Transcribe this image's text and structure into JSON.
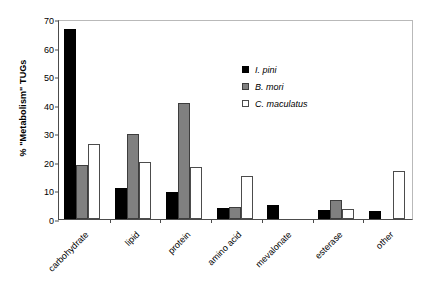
{
  "chart_data": {
    "type": "bar",
    "title": "",
    "xlabel": "",
    "ylabel": "% \"Metabolism\" TUGs",
    "ylim": [
      0,
      70
    ],
    "yticks": [
      0,
      10,
      20,
      30,
      40,
      50,
      60,
      70
    ],
    "ytick_labels": [
      "0",
      "10",
      "20",
      "30",
      "40",
      "50",
      "60",
      "70"
    ],
    "grid": false,
    "legend_position": "inside-upper-right",
    "categories": [
      "carbohydrate",
      "lipid",
      "protein",
      "amino acid",
      "mevalonate",
      "esterase",
      "other"
    ],
    "series": [
      {
        "name": "I. pini",
        "color": "#000000",
        "values": [
          66.5,
          10.7,
          9.3,
          4.0,
          5.0,
          3.0,
          2.9
        ]
      },
      {
        "name": "B. mori",
        "color": "#808080",
        "values": [
          19.0,
          29.8,
          40.7,
          4.3,
          0,
          6.8,
          0
        ]
      },
      {
        "name": "C. maculatus",
        "color": "#ffffff",
        "values": [
          26.3,
          20.0,
          18.2,
          15.0,
          0,
          3.5,
          16.7
        ]
      }
    ]
  },
  "legend": {
    "entries": [
      {
        "label": "I. pini",
        "swatch": "black-filled-square"
      },
      {
        "label": "B. mori",
        "swatch": "gray-filled-square"
      },
      {
        "label": "C. maculatus",
        "swatch": "white-outlined-square"
      }
    ]
  },
  "colors": {
    "series_1": "#000000",
    "series_2": "#808080",
    "series_3": "#ffffff",
    "axis": "#4c4c4c",
    "frame": "#b9b9b9",
    "background": "#ffffff"
  }
}
